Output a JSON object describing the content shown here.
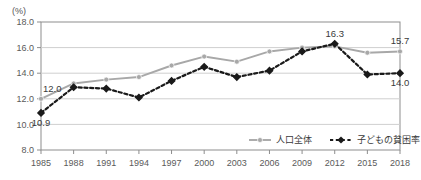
{
  "chart_data": {
    "type": "line",
    "title": "",
    "subtitle": "",
    "xlabel": "",
    "ylabel": "",
    "unit_label": "(%)",
    "categories": [
      "1985",
      "1988",
      "1991",
      "1994",
      "1997",
      "2000",
      "2003",
      "2006",
      "2009",
      "2012",
      "2015",
      "2018"
    ],
    "ylim": [
      8.0,
      18.0
    ],
    "ytick_step": 2.0,
    "yticks": [
      "8.0",
      "10.0",
      "12.0",
      "14.0",
      "16.0",
      "18.0"
    ],
    "grid": true,
    "legend_position": "bottom-right",
    "series": [
      {
        "name": "人口全体",
        "color": "#a8a8a8",
        "style": "solid",
        "marker": "circle",
        "values": [
          12.0,
          13.2,
          13.5,
          13.7,
          14.6,
          15.3,
          14.9,
          15.7,
          16.0,
          16.1,
          15.6,
          15.7
        ]
      },
      {
        "name": "子どもの貧困率",
        "color": "#1a1a1a",
        "style": "dashed",
        "marker": "diamond",
        "values": [
          10.9,
          12.9,
          12.8,
          12.1,
          13.4,
          14.5,
          13.7,
          14.2,
          15.7,
          16.3,
          13.9,
          14.0
        ]
      }
    ],
    "annotations": [
      {
        "text": "12.0",
        "series": "人口全体",
        "category": "1985",
        "position": "above-left"
      },
      {
        "text": "10.9",
        "series": "子どもの貧困率",
        "category": "1985",
        "position": "below"
      },
      {
        "text": "16.3",
        "series": "子どもの貧困率",
        "category": "2012",
        "position": "above"
      },
      {
        "text": "15.7",
        "series": "人口全体",
        "category": "2018",
        "position": "above"
      },
      {
        "text": "14.0",
        "series": "子どもの貧困率",
        "category": "2018",
        "position": "below"
      }
    ]
  }
}
